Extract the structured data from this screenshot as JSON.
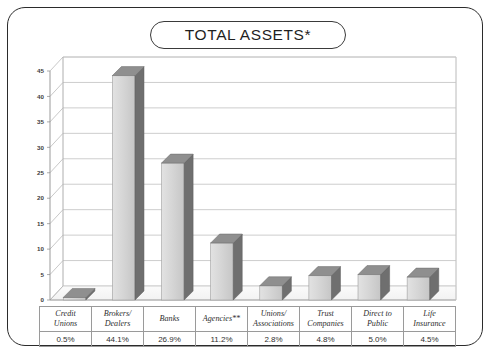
{
  "figure": {
    "title": "TOTAL ASSETS*"
  },
  "chart_data": {
    "type": "bar",
    "title": "TOTAL ASSETS*",
    "xlabel": "",
    "ylabel": "",
    "ylim": [
      0,
      45
    ],
    "yticks": [
      "0",
      "5",
      "10",
      "15",
      "20",
      "25",
      "30",
      "35",
      "40",
      "45"
    ],
    "grid": true,
    "legend": null,
    "three_d": true,
    "categories": [
      "Credit Unions",
      "Brokers/ Dealers",
      "Banks",
      "Agencies**",
      "Unions/ Associations",
      "Trust Companies",
      "Direct to Public",
      "Life Insurance"
    ],
    "category_lines": [
      [
        "Credit",
        "Unions"
      ],
      [
        "Brokers/",
        "Dealers"
      ],
      [
        "Banks",
        ""
      ],
      [
        "Agencies**",
        ""
      ],
      [
        "Unions/",
        "Associations"
      ],
      [
        "Trust",
        "Companies"
      ],
      [
        "Direct to",
        "Public"
      ],
      [
        "Life",
        "Insurance"
      ]
    ],
    "values": [
      0.5,
      44.1,
      26.9,
      11.2,
      2.8,
      4.8,
      5.0,
      4.5
    ],
    "value_labels": [
      "0.5%",
      "44.1%",
      "26.9%",
      "11.2%",
      "2.8%",
      "4.8%",
      "5.0%",
      "4.5%"
    ]
  },
  "colors": {
    "bar_front": "#d2d2d2",
    "bar_side": "#6f6f6f",
    "bar_top": "#8f8f8f",
    "frame": "#2b2b2b",
    "grid": "#b8b8b8",
    "text": "#2f2f2f"
  }
}
